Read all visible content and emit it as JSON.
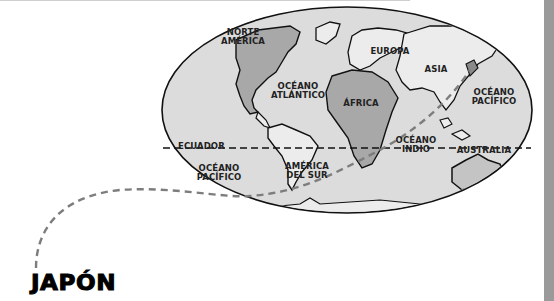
{
  "map": {
    "title_label": "JAPÓN",
    "equator_label": "ECUADOR",
    "regions": {
      "north_america": [
        "NORTE",
        "AMÉRICA"
      ],
      "atlantic": [
        "OCÉANO",
        "ATLÁNTICO"
      ],
      "europe": "EUROPA",
      "asia": "ASIA",
      "africa": "ÁFRICA",
      "pacific_east": [
        "OCÉANO",
        "PACÍFICO"
      ],
      "pacific_west": [
        "OCÉANO",
        "PACÍFICO"
      ],
      "south_america": [
        "AMÉRICA",
        "DEL SUR"
      ],
      "indian": [
        "OCÉANO",
        "INDIO"
      ],
      "australia": "AUSTRALIA"
    },
    "colors": {
      "ocean": "#dcdcdc",
      "land": "#ececec",
      "land_highlight": "#a8a8a8",
      "outline": "#111111",
      "route": "#7d7d7d",
      "side_bar": "#9a9a9a"
    }
  }
}
